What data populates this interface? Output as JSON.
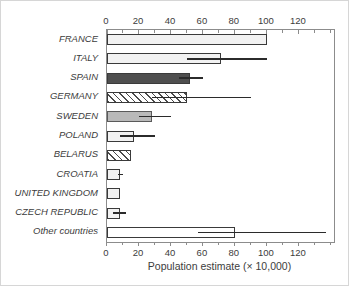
{
  "chart_data": {
    "type": "bar",
    "orientation": "horizontal",
    "title": "",
    "xlabel": "Population estimate (× 10,000)",
    "ylabel": "",
    "categories": [
      "FRANCE",
      "ITALY",
      "SPAIN",
      "GERMANY",
      "SWEDEN",
      "POLAND",
      "BELARUS",
      "CROATIA",
      "UNITED KINGDOM",
      "CZECH REPUBLIC",
      "Other countries"
    ],
    "values": [
      100,
      71,
      52,
      50,
      28,
      17,
      15,
      8,
      8,
      8,
      80
    ],
    "error_low": [
      null,
      50,
      45,
      28,
      20,
      8,
      null,
      7,
      null,
      4,
      57
    ],
    "error_high": [
      null,
      100,
      60,
      90,
      40,
      30,
      null,
      10,
      null,
      12,
      137
    ],
    "bar_styles": [
      "light",
      "light",
      "dark",
      "hatch",
      "gray",
      "light",
      "hatch",
      "light",
      "light",
      "light",
      "white"
    ],
    "xlim": [
      0,
      142
    ],
    "xticks_major": [
      0,
      20,
      40,
      60,
      80,
      100,
      120
    ],
    "xticks_minor_step": 10,
    "grid": "off",
    "legend": "none",
    "axes_position": "ticks on top and bottom, plot enclosed in box",
    "colors": {
      "light_fill": "#f2f2f2",
      "white_fill": "#ffffff",
      "dark_fill": "#4f4f4f",
      "gray_fill": "#b9b9b9",
      "hatch_line": "#4a4a4a",
      "bar_border": "#3a3a3a",
      "axis_line": "#8c8c8c",
      "error_line": "#2b2b2b",
      "text": "#3c3c3c"
    }
  }
}
